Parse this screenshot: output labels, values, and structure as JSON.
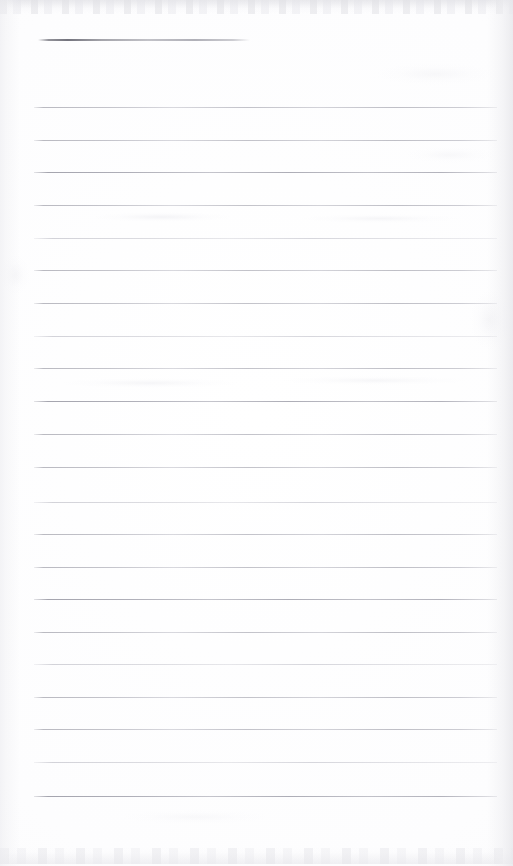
{
  "document": {
    "kind": "scanned-page",
    "subject": "blank ruled notepad sheet",
    "page_width": 513,
    "page_height": 866,
    "background_color": "#fdfdfd",
    "ink_color": "#b4b4bc",
    "header_rule_color": "#70707a",
    "visible_text": "",
    "notes": "No typed or handwritten text is present on the sheet."
  },
  "header_rule": {
    "name": "header-rule",
    "x": 38,
    "y": 39,
    "width": 212,
    "thickness": 2
  },
  "ruled_area": {
    "left": 34,
    "right": 497,
    "width": 463,
    "first_line_y": 107,
    "line_spacing": 32.8,
    "line_count": 22,
    "thickness": 1
  },
  "ruled_lines": [
    {
      "index": 1,
      "y": 107,
      "weight": "normal"
    },
    {
      "index": 2,
      "y": 139.5,
      "weight": "normal"
    },
    {
      "index": 3,
      "y": 172,
      "weight": "heavier"
    },
    {
      "index": 4,
      "y": 205,
      "weight": "normal"
    },
    {
      "index": 5,
      "y": 237.5,
      "weight": "lighter"
    },
    {
      "index": 6,
      "y": 270,
      "weight": "normal"
    },
    {
      "index": 7,
      "y": 302.5,
      "weight": "normal"
    },
    {
      "index": 8,
      "y": 335.5,
      "weight": "lighter"
    },
    {
      "index": 9,
      "y": 368,
      "weight": "normal"
    },
    {
      "index": 10,
      "y": 401,
      "weight": "heavier"
    },
    {
      "index": 11,
      "y": 433.5,
      "weight": "normal"
    },
    {
      "index": 12,
      "y": 466.5,
      "weight": "normal"
    },
    {
      "index": 13,
      "y": 501.5,
      "weight": "lighter"
    },
    {
      "index": 14,
      "y": 534,
      "weight": "normal"
    },
    {
      "index": 15,
      "y": 566.5,
      "weight": "normal"
    },
    {
      "index": 16,
      "y": 599,
      "weight": "heavier"
    },
    {
      "index": 17,
      "y": 631.5,
      "weight": "normal"
    },
    {
      "index": 18,
      "y": 664,
      "weight": "lighter"
    },
    {
      "index": 19,
      "y": 696.5,
      "weight": "normal"
    },
    {
      "index": 20,
      "y": 729,
      "weight": "normal"
    },
    {
      "index": 21,
      "y": 761.5,
      "weight": "lighter"
    },
    {
      "index": 22,
      "y": 796,
      "weight": "heavier"
    }
  ],
  "scan_artifacts": {
    "top_band": {
      "y": 0,
      "height": 14
    },
    "bottom_band": {
      "y": 848,
      "height": 16
    },
    "blotches": [
      {
        "x": 92,
        "y": 212,
        "w": 140,
        "h": 10,
        "opacity": 0.35
      },
      {
        "x": 300,
        "y": 214,
        "w": 160,
        "h": 9,
        "opacity": 0.3
      },
      {
        "x": 60,
        "y": 378,
        "w": 180,
        "h": 10,
        "opacity": 0.3
      },
      {
        "x": 280,
        "y": 376,
        "w": 190,
        "h": 9,
        "opacity": 0.28
      },
      {
        "x": 375,
        "y": 63,
        "w": 120,
        "h": 22,
        "opacity": 0.22
      },
      {
        "x": 470,
        "y": 290,
        "w": 40,
        "h": 60,
        "opacity": 0.3
      },
      {
        "x": 0,
        "y": 255,
        "w": 30,
        "h": 40,
        "opacity": 0.25
      },
      {
        "x": 405,
        "y": 147,
        "w": 90,
        "h": 16,
        "opacity": 0.2
      },
      {
        "x": 120,
        "y": 810,
        "w": 150,
        "h": 14,
        "opacity": 0.18
      }
    ]
  }
}
